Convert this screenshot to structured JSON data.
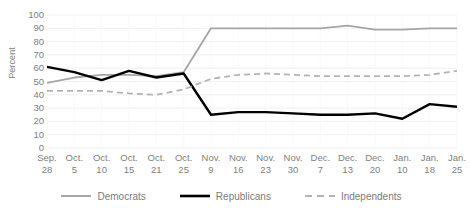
{
  "chart_data": {
    "type": "line",
    "title": "",
    "xlabel": "",
    "ylabel": "Percent",
    "ylim": [
      0,
      100
    ],
    "ytick_step": 10,
    "yticks": [
      100,
      90,
      80,
      70,
      60,
      50,
      40,
      30,
      20,
      10,
      0
    ],
    "grid": true,
    "legend_position": "bottom",
    "categories": [
      "Sep. 28",
      "Oct. 5",
      "Oct. 10",
      "Oct. 15",
      "Oct. 21",
      "Oct. 25",
      "Nov. 9",
      "Nov. 16",
      "Nov. 23",
      "Nov. 30",
      "Dec. 7",
      "Dec. 13",
      "Dec. 20",
      "Jan. 10",
      "Jan. 18",
      "Jan. 25"
    ],
    "categories_split": [
      {
        "line1": "Sep.",
        "line2": "28"
      },
      {
        "line1": "Oct.",
        "line2": "5"
      },
      {
        "line1": "Oct.",
        "line2": "10"
      },
      {
        "line1": "Oct.",
        "line2": "15"
      },
      {
        "line1": "Oct.",
        "line2": "21"
      },
      {
        "line1": "Oct.",
        "line2": "25"
      },
      {
        "line1": "Nov.",
        "line2": "9"
      },
      {
        "line1": "Nov.",
        "line2": "16"
      },
      {
        "line1": "Nov.",
        "line2": "23"
      },
      {
        "line1": "Nov.",
        "line2": "30"
      },
      {
        "line1": "Dec.",
        "line2": "7"
      },
      {
        "line1": "Dec.",
        "line2": "13"
      },
      {
        "line1": "Dec.",
        "line2": "20"
      },
      {
        "line1": "Jan.",
        "line2": "10"
      },
      {
        "line1": "Jan.",
        "line2": "18"
      },
      {
        "line1": "Jan.",
        "line2": "25"
      }
    ],
    "series": [
      {
        "name": "Democrats",
        "color": "#a6a6a6",
        "style": "solid",
        "values": [
          49,
          53,
          55,
          55,
          54,
          57,
          90,
          90,
          90,
          90,
          90,
          92,
          89,
          89,
          90,
          90
        ]
      },
      {
        "name": "Republicans",
        "color": "#000000",
        "style": "solid",
        "values": [
          61,
          57,
          51,
          58,
          53,
          56,
          25,
          27,
          27,
          26,
          25,
          25,
          26,
          22,
          33,
          31
        ]
      },
      {
        "name": "Independents",
        "color": "#b3b3b3",
        "style": "dashed",
        "values": [
          43,
          43,
          43,
          41,
          40,
          44,
          52,
          55,
          56,
          55,
          54,
          54,
          54,
          54,
          55,
          58
        ]
      }
    ]
  },
  "legend": {
    "items": [
      {
        "label": "Democrats"
      },
      {
        "label": "Republicans"
      },
      {
        "label": "Independents"
      }
    ]
  }
}
